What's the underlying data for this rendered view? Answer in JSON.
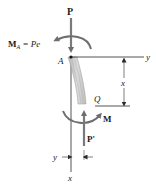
{
  "diagram": {
    "colors": {
      "force_arrow": "#7a7a7a",
      "moment_arrow": "#6e6e6e",
      "axis_line": "#2a2a2a",
      "column_fill": "#c9c9c9",
      "column_stroke": "#9a9a9a",
      "text": "#1a1a1a"
    },
    "labels": {
      "load_top": "P",
      "moment_top_symbol": "M",
      "moment_top_subscript": "A",
      "moment_top_rhs": " = Pe",
      "point_a": "A",
      "axis_y_top": "y",
      "dimension_x": "x",
      "point_q": "Q",
      "moment_bottom": "M",
      "load_bottom": "P'",
      "axis_y_bottom": "y",
      "axis_x_bottom": "x"
    }
  }
}
